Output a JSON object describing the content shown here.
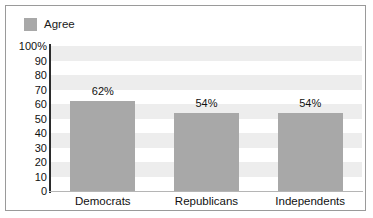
{
  "chart_data": {
    "type": "bar",
    "title": "",
    "xlabel": "",
    "ylabel": "",
    "categories": [
      "Democrats",
      "Republicans",
      "Independents"
    ],
    "values": [
      62,
      54,
      54
    ],
    "value_labels": [
      "62%",
      "54%",
      "54%"
    ],
    "series": [
      {
        "name": "Agree",
        "values": [
          62,
          54,
          54
        ],
        "color": "#a8a8a8"
      }
    ],
    "ylim": [
      0,
      100
    ],
    "y_ticks": [
      {
        "value": 100,
        "label": "100%"
      },
      {
        "value": 90,
        "label": "90"
      },
      {
        "value": 80,
        "label": "80"
      },
      {
        "value": 70,
        "label": "70"
      },
      {
        "value": 60,
        "label": "60"
      },
      {
        "value": 50,
        "label": "50"
      },
      {
        "value": 40,
        "label": "40"
      },
      {
        "value": 30,
        "label": "30"
      },
      {
        "value": 20,
        "label": "20"
      },
      {
        "value": 10,
        "label": "10"
      },
      {
        "value": 0,
        "label": "0"
      }
    ],
    "grid": "alternating-horizontal-bands",
    "legend_position": "top-left",
    "legend": [
      {
        "label": "Agree",
        "color": "#a8a8a8"
      }
    ],
    "colors": {
      "bar": "#a8a8a8",
      "band": "#ededed",
      "plot_background": "#ffffff",
      "axis": "#2b2b2b",
      "frame_border": "#9a9a9a",
      "text": "#111111"
    }
  }
}
